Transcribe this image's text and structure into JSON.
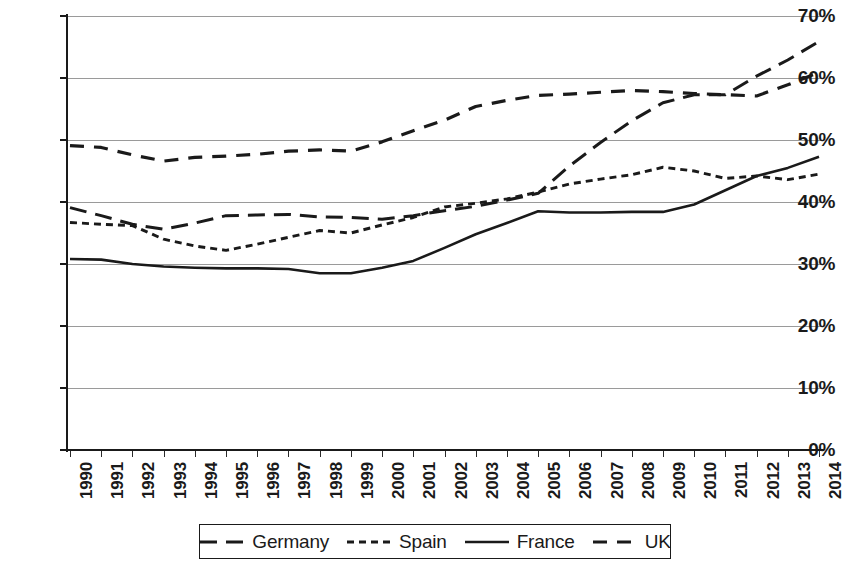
{
  "chart_data": {
    "type": "line",
    "title": "",
    "subtitle": "",
    "xlabel": "",
    "ylabel": "",
    "grid": true,
    "legend_position": "bottom",
    "ylim": [
      0,
      70
    ],
    "ytick_labels": [
      "70%",
      "60%",
      "50%",
      "40%",
      "30%",
      "20%",
      "10%",
      "0%"
    ],
    "ytick_values": [
      70,
      60,
      50,
      40,
      30,
      20,
      10,
      0
    ],
    "x": [
      1990,
      1991,
      1992,
      1993,
      1994,
      1995,
      1996,
      1997,
      1998,
      1999,
      2000,
      2001,
      2002,
      2003,
      2004,
      2005,
      2006,
      2007,
      2008,
      2009,
      2010,
      2011,
      2012,
      2013,
      2014
    ],
    "xtick_labels": [
      "1990",
      "1991",
      "1992",
      "1993",
      "1994",
      "1995",
      "1996",
      "1997",
      "1998",
      "1999",
      "2000",
      "2001",
      "2002",
      "2003",
      "2004",
      "2005",
      "2006",
      "2007",
      "2008",
      "2009",
      "2010",
      "2011",
      "2012",
      "2013",
      "2014"
    ],
    "series": [
      {
        "name": "Germany",
        "dash": "long-dash",
        "color": "#1a1a1a",
        "values": [
          39.1,
          37.8,
          36.4,
          35.6,
          36.6,
          37.8,
          37.9,
          38.0,
          37.6,
          37.5,
          37.2,
          37.8,
          38.6,
          39.3,
          40.3,
          41.4,
          45.8,
          49.6,
          53.1,
          56.0,
          57.3,
          57.3,
          60.3,
          62.9,
          65.9
        ]
      },
      {
        "name": "Spain",
        "dash": "short-dash",
        "color": "#1a1a1a",
        "values": [
          36.7,
          36.4,
          36.2,
          34.0,
          32.9,
          32.2,
          33.2,
          34.3,
          35.4,
          35.0,
          36.3,
          37.5,
          39.2,
          39.8,
          40.5,
          41.6,
          42.9,
          43.7,
          44.4,
          45.6,
          45.0,
          43.8,
          44.2,
          43.6,
          44.5
        ]
      },
      {
        "name": "France",
        "dash": "solid",
        "color": "#1a1a1a",
        "values": [
          30.8,
          30.7,
          30.0,
          29.6,
          29.4,
          29.3,
          29.3,
          29.2,
          28.5,
          28.5,
          29.4,
          30.5,
          32.6,
          34.8,
          36.6,
          38.5,
          38.3,
          38.3,
          38.4,
          38.4,
          39.6,
          41.9,
          44.2,
          45.5,
          47.3
        ]
      },
      {
        "name": "UK",
        "dash": "dash-dash",
        "color": "#1a1a1a",
        "values": [
          49.1,
          48.8,
          47.6,
          46.6,
          47.2,
          47.4,
          47.7,
          48.2,
          48.4,
          48.2,
          49.7,
          51.5,
          53.2,
          55.4,
          56.4,
          57.2,
          57.4,
          57.7,
          58.0,
          57.8,
          57.5,
          57.3,
          57.1,
          58.9,
          60.9
        ]
      }
    ]
  },
  "legend": {
    "items": [
      {
        "label": "Germany",
        "dash": "long-dash"
      },
      {
        "label": "Spain",
        "dash": "short-dash"
      },
      {
        "label": "France",
        "dash": "solid"
      },
      {
        "label": "UK",
        "dash": "dash-dash"
      }
    ]
  }
}
